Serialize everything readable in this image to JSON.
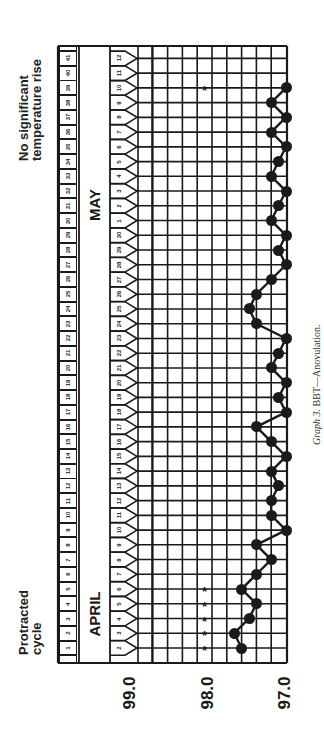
{
  "titles": {
    "left_line1": "Protracted",
    "left_line2": "cycle",
    "right_line1": "No significant",
    "right_line2": "temperature rise"
  },
  "months": {
    "first": "APRIL",
    "second": "MAY"
  },
  "caption": {
    "italic": "Graph 3.",
    "text": " BBT—Anovulation."
  },
  "y_labels": [
    "99.0",
    "98.0",
    "97.0"
  ],
  "chart_data": {
    "type": "line",
    "title": "Graph 3. BBT—Anovulation.",
    "subtitle_left": "Protracted cycle",
    "subtitle_right": "No significant temperature rise",
    "orientation": "rotated 90° counter-clockwise (time runs bottom→top, temperature increases right→left)",
    "xlabel": "Date / cycle day",
    "ylabel": "Basal body temperature (°F)",
    "ylim": [
      97.0,
      99.0
    ],
    "y_ticks": [
      "99.0",
      "98.0",
      "97.0"
    ],
    "grid": true,
    "cycle_days": [
      1,
      2,
      3,
      4,
      5,
      6,
      7,
      8,
      9,
      10,
      11,
      12,
      13,
      14,
      15,
      16,
      17,
      18,
      19,
      20,
      21,
      22,
      23,
      24,
      25,
      26,
      27,
      28,
      29,
      30,
      31,
      32,
      33,
      34,
      35,
      36,
      37,
      38,
      39,
      40,
      41
    ],
    "dates": [
      "2",
      "3",
      "4",
      "5",
      "6",
      "7",
      "8",
      "9",
      "10",
      "11",
      "12",
      "13",
      "14",
      "15",
      "16",
      "17",
      "18",
      "19",
      "20",
      "21",
      "22",
      "23",
      "24",
      "25",
      "26",
      "27",
      "28",
      "29",
      "30",
      "1",
      "2",
      "3",
      "4",
      "5",
      "6",
      "7",
      "8",
      "9",
      "10",
      "11",
      "12"
    ],
    "date_months": [
      "APRIL",
      "APRIL",
      "APRIL",
      "APRIL",
      "APRIL",
      "APRIL",
      "APRIL",
      "APRIL",
      "APRIL",
      "APRIL",
      "APRIL",
      "APRIL",
      "APRIL",
      "APRIL",
      "APRIL",
      "APRIL",
      "APRIL",
      "APRIL",
      "APRIL",
      "APRIL",
      "APRIL",
      "APRIL",
      "APRIL",
      "APRIL",
      "APRIL",
      "APRIL",
      "APRIL",
      "APRIL",
      "APRIL",
      "MAY",
      "MAY",
      "MAY",
      "MAY",
      "MAY",
      "MAY",
      "MAY",
      "MAY",
      "MAY",
      "MAY",
      "MAY",
      "MAY"
    ],
    "series": [
      {
        "name": "BBT",
        "values": [
          97.6,
          97.7,
          97.5,
          97.4,
          97.6,
          97.4,
          97.2,
          97.4,
          97.0,
          97.2,
          97.2,
          97.1,
          97.2,
          97.0,
          97.2,
          97.4,
          97.0,
          97.1,
          97.0,
          97.2,
          97.1,
          97.0,
          97.4,
          97.5,
          97.4,
          97.2,
          97.0,
          97.1,
          97.0,
          97.2,
          97.1,
          97.0,
          97.2,
          97.1,
          97.0,
          97.2,
          97.0,
          97.2,
          97.0,
          null,
          null
        ]
      }
    ],
    "annotations": [
      {
        "symbol": "*",
        "date_indices": [
          0,
          1,
          2,
          3,
          4
        ],
        "note": "asterisks near 98.1 on April 2–6 (menstruation markers)"
      },
      {
        "symbol": "*",
        "date_indices": [
          38
        ],
        "note": "asterisk near 98.1 on May 10"
      }
    ]
  }
}
